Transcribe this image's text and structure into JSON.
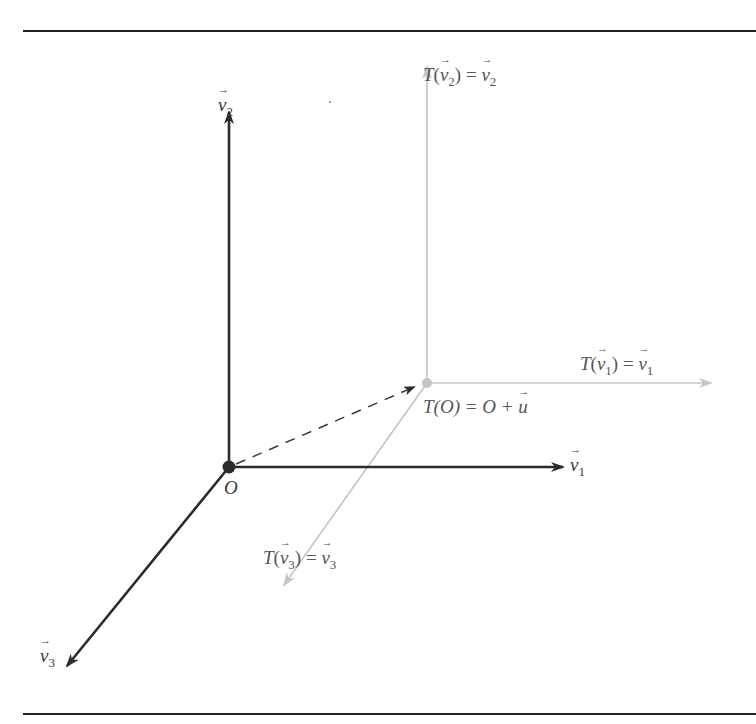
{
  "diagram": {
    "colors": {
      "dark_axis": "#2b2b2b",
      "light_axis": "#c4c4c4",
      "rule": "#222222",
      "dashed": "#3a3a3a"
    },
    "origin": {
      "label": "O",
      "position": [
        229,
        467
      ]
    },
    "translated_origin": {
      "label_T": "T",
      "label_expr": "(O) = O + ",
      "label_u": "u",
      "position": [
        427,
        383
      ]
    },
    "axes": [
      {
        "name": "v1",
        "letter": "v",
        "subscript": "1",
        "from": [
          229,
          467
        ],
        "to": [
          565,
          467
        ],
        "style": "dark"
      },
      {
        "name": "v2",
        "letter": "v",
        "subscript": "2",
        "from": [
          229,
          467
        ],
        "to": [
          229,
          110
        ],
        "style": "dark"
      },
      {
        "name": "v3",
        "letter": "v",
        "subscript": "3",
        "from": [
          229,
          467
        ],
        "to": [
          65,
          668
        ],
        "style": "dark"
      }
    ],
    "translated_axes": [
      {
        "name": "T(v1)",
        "T": "T",
        "letter": "v",
        "subscript": "1",
        "eq": " = ",
        "from": [
          427,
          383
        ],
        "to": [
          713,
          383
        ],
        "style": "light"
      },
      {
        "name": "T(v2)",
        "T": "T",
        "letter": "v",
        "subscript": "2",
        "eq": " = ",
        "from": [
          427,
          383
        ],
        "to": [
          427,
          65
        ],
        "style": "light"
      },
      {
        "name": "T(v3)",
        "T": "T",
        "letter": "v",
        "subscript": "3",
        "eq": " = ",
        "from": [
          427,
          383
        ],
        "to": [
          283,
          587
        ],
        "style": "light"
      }
    ],
    "translation_vector": {
      "name": "u",
      "from": [
        229,
        467
      ],
      "to": [
        415,
        386
      ],
      "style": "dashed"
    },
    "rules": {
      "top_y": 31,
      "bottom_y": 714,
      "x_start": 23,
      "x_end": 756
    }
  }
}
